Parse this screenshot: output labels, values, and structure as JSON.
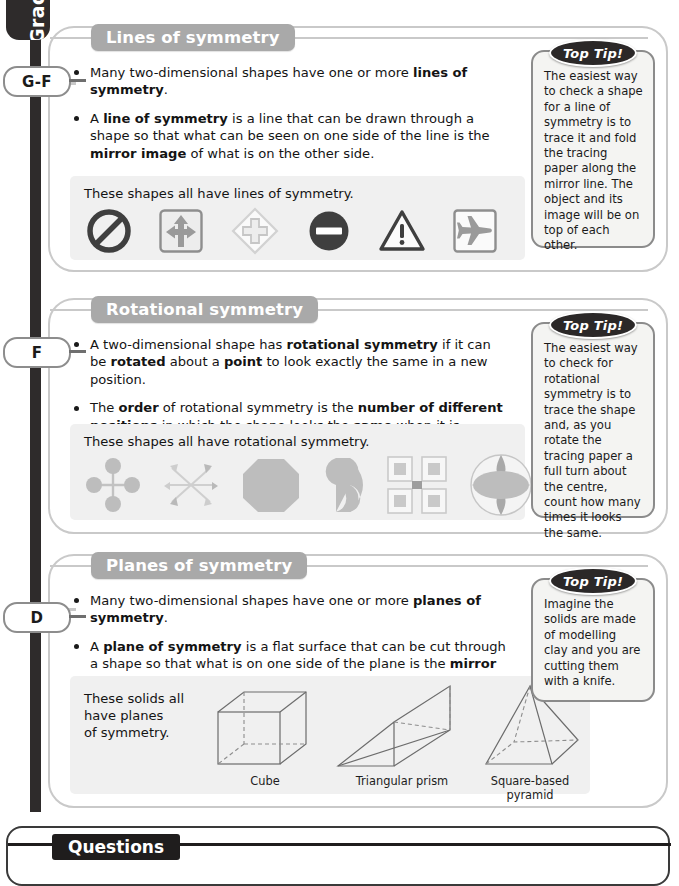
{
  "spine": {
    "tab_label": "Grades",
    "grades": [
      {
        "label": "G-F",
        "top": 66
      },
      {
        "label": "F",
        "top": 337
      },
      {
        "label": "D",
        "top": 602
      }
    ]
  },
  "sections": [
    {
      "id": "lines-of-symmetry",
      "title": "Lines of symmetry",
      "points": [
        "Many two-dimensional shapes have one or more <b>lines of symmetry</b>.",
        "A <b>line of symmetry</b> is a line that can be drawn through a shape so that what can be seen on one side of the line is the <b>mirror image</b> of what is on the other side.",
        "Lines of symmetry are also called <b>mirror lines</b>."
      ],
      "example_caption": "These shapes all have lines of symmetry.",
      "shapes": [
        "prohibition-sign-shape",
        "arrows-square-sign-shape",
        "cross-diamond-sign-shape",
        "no-entry-sign-shape",
        "warning-triangle-sign-shape",
        "airplane-square-sign-shape"
      ],
      "tip": {
        "badge": "Top Tip!",
        "text": "The easiest way to check a shape for a line of symmetry is to trace it and fold the tracing paper along the mirror line. The object and its image will be on top of each other."
      }
    },
    {
      "id": "rotational-symmetry",
      "title": "Rotational symmetry",
      "points": [
        "A two-dimensional shape has <b>rotational symmetry</b> if it can be <b>rotated</b> about a <b>point</b> to look exactly the same in a new position.",
        "The <b>order</b> of rotational symmetry is the <b>number of different positions</b> in which the shape looks the <b>same</b> when it is rotated."
      ],
      "example_caption": "These shapes all have rotational symmetry.",
      "shapes": [
        "cross-with-circles-shape",
        "pinwheel-arrows-shape",
        "octagon-shape",
        "s-curve-shape",
        "four-squares-pattern-shape",
        "circle-with-petals-shape"
      ],
      "tip": {
        "badge": "Top Tip!",
        "text": "The easiest way to check for rotational symmetry is to trace the shape and, as you rotate the tracing paper a full turn about the centre, count how many times it looks the same."
      }
    },
    {
      "id": "planes-of-symmetry",
      "title": "Planes of symmetry",
      "points": [
        "Many two-dimensional shapes have one or more <b>planes of symmetry</b>.",
        "A <b>plane of symmetry</b> is a flat surface that can be cut through a shape so that what is on one side of the plane is the <b>mirror image</b> of what is on the other side."
      ],
      "example_caption": "These solids all\nhave planes\nof symmetry.",
      "solids": [
        {
          "name": "cube-diagram",
          "label": "Cube"
        },
        {
          "name": "triangular-prism-diagram",
          "label": "Triangular prism"
        },
        {
          "name": "square-based-pyramid-diagram",
          "label": "Square-based pyramid"
        }
      ],
      "tip": {
        "badge": "Top Tip!",
        "text": "Imagine the solids are made of modelling clay and you are cutting them with a knife."
      }
    }
  ],
  "questions": {
    "title": "Questions"
  },
  "colors": {
    "spine": "#2e2b2b",
    "section_header": "#a9a9a9",
    "card_border": "#c9c9c9",
    "example_panel": "#f0f0f0",
    "shape_fill": "#b9b9b9",
    "tip_border": "#8b8b8b",
    "tip_badge": "#2b2828"
  }
}
